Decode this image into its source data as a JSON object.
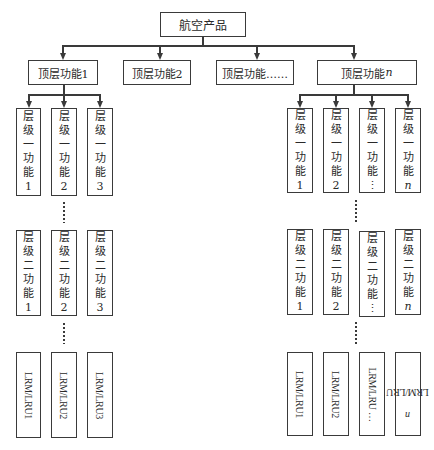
{
  "root": {
    "label": "航空产品"
  },
  "top_functions": [
    {
      "label": "顶层功能1"
    },
    {
      "label": "顶层功能2"
    },
    {
      "label": "顶层功能……"
    },
    {
      "label": "顶层功能",
      "suffix": "n"
    }
  ],
  "left_branch": {
    "parent": "顶层功能1",
    "level1": [
      {
        "chars": [
          "层",
          "级",
          "一",
          "功",
          "能"
        ],
        "index": "1"
      },
      {
        "chars": [
          "层",
          "级",
          "一",
          "功",
          "能"
        ],
        "index": "2"
      },
      {
        "chars": [
          "层",
          "级",
          "一",
          "功",
          "能"
        ],
        "index": "3"
      }
    ],
    "level2": [
      {
        "chars": [
          "层",
          "级",
          "二",
          "功",
          "能"
        ],
        "index": "1"
      },
      {
        "chars": [
          "层",
          "级",
          "二",
          "功",
          "能"
        ],
        "index": "2"
      },
      {
        "chars": [
          "层",
          "级",
          "二",
          "功",
          "能"
        ],
        "index": "3"
      }
    ],
    "lru": [
      {
        "label": "LRM/LRU1"
      },
      {
        "label": "LRM/LRU2"
      },
      {
        "label": "LRM/LRU3"
      }
    ]
  },
  "right_branch": {
    "parent": "顶层功能n",
    "level1": [
      {
        "chars": [
          "层",
          "级",
          "一",
          "功",
          "能"
        ],
        "index": "1"
      },
      {
        "chars": [
          "层",
          "级",
          "一",
          "功",
          "能"
        ],
        "index": "2"
      },
      {
        "chars": [
          "层",
          "级",
          "一",
          "功",
          "能"
        ],
        "index": "⋮"
      },
      {
        "chars": [
          "层",
          "级",
          "一",
          "功",
          "能"
        ],
        "index": "n"
      }
    ],
    "level2": [
      {
        "chars": [
          "层",
          "级",
          "二",
          "功",
          "能"
        ],
        "index": "1"
      },
      {
        "chars": [
          "层",
          "级",
          "二",
          "功",
          "能"
        ],
        "index": "2"
      },
      {
        "chars": [
          "层",
          "级",
          "二",
          "功",
          "能"
        ],
        "index": "⋮"
      },
      {
        "chars": [
          "层",
          "级",
          "二",
          "功",
          "能"
        ],
        "index": "n"
      }
    ],
    "lru": [
      {
        "label": "LRM/LRU1"
      },
      {
        "label": "LRM/LRU2"
      },
      {
        "label": "LRM/LRU …"
      },
      {
        "label": "LRM/LRU",
        "suffix": "n"
      }
    ]
  },
  "ellipsis": "⋮",
  "colors": {
    "line": "#3a3a3a",
    "text": "#2a2a2a",
    "background": "#ffffff"
  }
}
